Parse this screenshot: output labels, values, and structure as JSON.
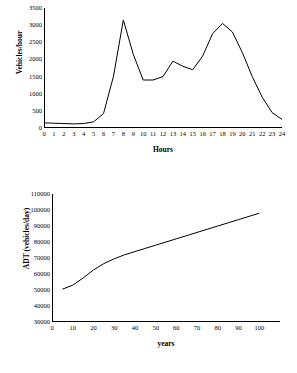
{
  "figure": {
    "background": "#ffffff",
    "line_color": "#000000",
    "axis_color": "#000000"
  },
  "chart_data": [
    {
      "id": "hourly-traffic-profile",
      "type": "line",
      "title": "",
      "xlabel": "Hours",
      "ylabel": "Vehicles/hour",
      "xlim": [
        0,
        24
      ],
      "ylim": [
        0,
        3500
      ],
      "grid": false,
      "legend": "none",
      "xticks": [
        0,
        1,
        2,
        3,
        4,
        5,
        6,
        7,
        8,
        9,
        10,
        11,
        12,
        13,
        14,
        15,
        16,
        17,
        18,
        19,
        20,
        21,
        22,
        23,
        24
      ],
      "yticks": [
        0,
        500,
        1000,
        1500,
        2000,
        2500,
        3000,
        3500
      ],
      "x": [
        0,
        1,
        2,
        3,
        4,
        5,
        6,
        7,
        8,
        9,
        10,
        11,
        12,
        13,
        14,
        15,
        16,
        17,
        18,
        19,
        20,
        21,
        22,
        23,
        24
      ],
      "values": [
        150,
        140,
        130,
        120,
        130,
        180,
        420,
        1500,
        3150,
        2150,
        1400,
        1400,
        1500,
        1950,
        1800,
        1700,
        2100,
        2750,
        3050,
        2800,
        2200,
        1500,
        900,
        450,
        250
      ]
    },
    {
      "id": "adt-growth",
      "type": "line",
      "title": "",
      "xlabel": "years",
      "ylabel": "ADT (vehicles/day)",
      "xlim": [
        0,
        110
      ],
      "ylim": [
        30000,
        110000
      ],
      "grid": false,
      "legend": "none",
      "xticks": [
        0,
        10,
        20,
        30,
        40,
        50,
        60,
        70,
        80,
        90,
        100
      ],
      "yticks": [
        30000,
        40000,
        50000,
        60000,
        70000,
        80000,
        90000,
        100000,
        110000
      ],
      "x": [
        5,
        10,
        15,
        20,
        25,
        30,
        35,
        40,
        45,
        50,
        55,
        60,
        65,
        70,
        75,
        80,
        85,
        90,
        95,
        100
      ],
      "values": [
        50500,
        53000,
        57500,
        62500,
        66500,
        69500,
        72000,
        74000,
        76000,
        78000,
        80000,
        82000,
        84000,
        86000,
        88000,
        90000,
        92000,
        94000,
        96000,
        98000
      ]
    }
  ]
}
